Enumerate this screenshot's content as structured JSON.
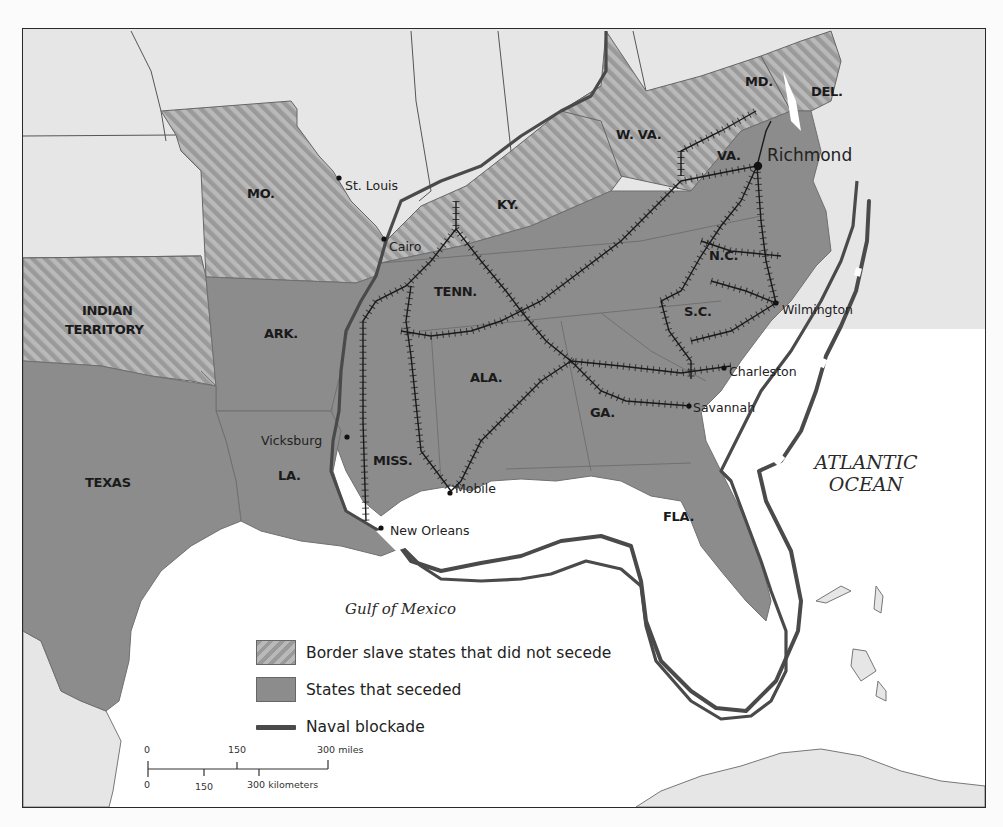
{
  "map": {
    "states": {
      "mo": "MO.",
      "ky": "KY.",
      "w_va": "W. VA.",
      "md": "MD.",
      "del": "DEL.",
      "va": "VA.",
      "nc": "N.C.",
      "sc": "S.C.",
      "tenn": "TENN.",
      "ark": "ARK.",
      "indian_territory_1": "INDIAN",
      "indian_territory_2": "TERRITORY",
      "ala": "ALA.",
      "ga": "GA.",
      "miss": "MISS.",
      "la": "LA.",
      "texas": "TEXAS",
      "fla": "FLA."
    },
    "cities": {
      "st_louis": "St. Louis",
      "cairo": "Cairo",
      "richmond": "Richmond",
      "wilmington": "Wilmington",
      "charleston": "Charleston",
      "savannah": "Savannah",
      "vicksburg": "Vicksburg",
      "mobile": "Mobile",
      "new_orleans": "New Orleans"
    },
    "water": {
      "gulf": "Gulf of Mexico",
      "atlantic_1": "ATLANTIC",
      "atlantic_2": "OCEAN"
    },
    "colors": {
      "union_states": "#e6e6e6",
      "seceded_states": "#8c8c8c",
      "border_states_stripe_a": "#9a9a9a",
      "border_states_stripe_b": "#b9b9b9",
      "blockade_line": "#4a4a4a",
      "railroad": "#1a1a1a",
      "water": "#ffffff"
    }
  },
  "legend": {
    "items": [
      {
        "label": "Border slave states that did not secede",
        "symbol": "hatched-swatch"
      },
      {
        "label": "States that seceded",
        "symbol": "solid-swatch"
      },
      {
        "label": "Naval blockade",
        "symbol": "thick-line"
      }
    ]
  },
  "scale_bar": {
    "miles": {
      "ticks": [
        "0",
        "150",
        "300 miles"
      ]
    },
    "kilometers": {
      "ticks": [
        "0",
        "150",
        "300 kilometers"
      ]
    }
  }
}
